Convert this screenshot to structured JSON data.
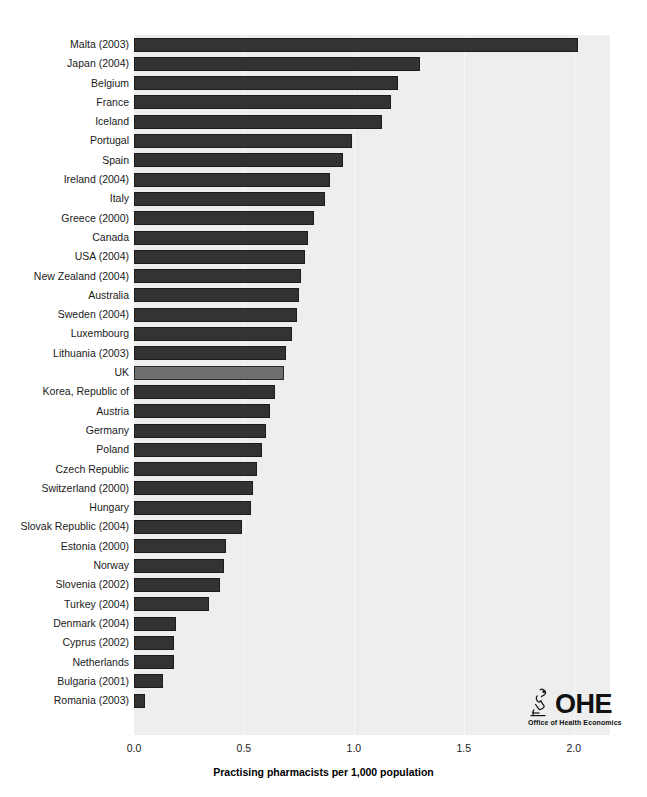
{
  "chart_data": {
    "type": "bar",
    "orientation": "horizontal",
    "title": "",
    "xlabel": "Practising pharmacists per 1,000 population",
    "ylabel": "",
    "xlim": [
      0.0,
      2.165
    ],
    "xticks": [
      0.0,
      0.5,
      1.0,
      1.5,
      2.0
    ],
    "xtick_labels": [
      "0.0",
      "0.5",
      "1.0",
      "1.5",
      "2.0"
    ],
    "grid": "vertical",
    "legend": "none",
    "highlight_category": "UK",
    "categories": [
      "Malta (2003)",
      "Japan (2004)",
      "Belgium",
      "France",
      "Iceland",
      "Portugal",
      "Spain",
      "Ireland (2004)",
      "Italy",
      "Greece (2000)",
      "Canada",
      "USA (2004)",
      "New Zealand (2004)",
      "Australia",
      "Sweden (2004)",
      "Luxembourg",
      "Lithuania (2003)",
      "UK",
      "Korea, Republic of",
      "Austria",
      "Germany",
      "Poland",
      "Czech Republic",
      "Switzerland (2000)",
      "Hungary",
      "Slovak Republic (2004)",
      "Estonia (2000)",
      "Norway",
      "Slovenia (2002)",
      "Turkey (2004)",
      "Denmark (2004)",
      "Cyprus (2002)",
      "Netherlands",
      "Bulgaria (2001)",
      "Romania (2003)"
    ],
    "values": [
      2.02,
      1.3,
      1.2,
      1.17,
      1.13,
      0.99,
      0.95,
      0.89,
      0.87,
      0.82,
      0.79,
      0.78,
      0.76,
      0.75,
      0.74,
      0.72,
      0.69,
      0.68,
      0.64,
      0.62,
      0.6,
      0.58,
      0.56,
      0.54,
      0.53,
      0.49,
      0.42,
      0.41,
      0.39,
      0.34,
      0.19,
      0.18,
      0.18,
      0.13,
      0.05
    ]
  },
  "colors": {
    "plot_background": "#eeeeee",
    "bar": "#333333",
    "bar_highlight": "#6e6e6e",
    "gridline": "#f8f8f8",
    "text": "#1a1a1a"
  },
  "logo": {
    "word": "OHE",
    "subtitle": "Office of Health Economics",
    "mark": "microscope-icon"
  }
}
